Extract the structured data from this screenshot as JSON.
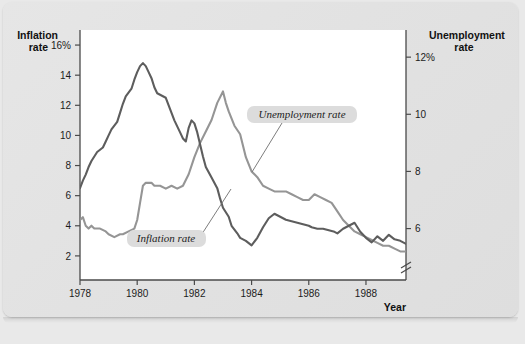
{
  "figure": {
    "background_color": "#e3e3e3",
    "plot_background_color": "#ffffff",
    "border_color": "#555555"
  },
  "labels": {
    "left_axis_title_line1": "Inflation",
    "left_axis_title_line2": "rate",
    "right_axis_title_line1": "Unemployment",
    "right_axis_title_line2": "rate",
    "x_axis_title": "Year"
  },
  "annotations": {
    "unemployment": "Unemployment rate",
    "inflation": "Inflation rate"
  },
  "chart_data": {
    "type": "line",
    "title": "",
    "subtitle": "",
    "xlabel": "Year",
    "ylabel": "Inflation rate",
    "y2label": "Unemployment rate",
    "grid": false,
    "legend": "annotations-inline",
    "xlim": [
      1978.0,
      1989.4
    ],
    "xticks": [
      1978,
      1980,
      1982,
      1984,
      1986,
      1988
    ],
    "xticklabels": [
      "1978",
      "1980",
      "1982",
      "1984",
      "1986",
      "1988"
    ],
    "ylim": [
      0.4,
      17.0
    ],
    "yticks": [
      2,
      4,
      6,
      8,
      10,
      12,
      14,
      16
    ],
    "yticklabels": [
      "2",
      "4",
      "6",
      "8",
      "10",
      "12",
      "14",
      "16%"
    ],
    "y2lim": [
      4.2,
      12.95
    ],
    "y2ticks": [
      6,
      8,
      10,
      12
    ],
    "y2ticklabels": [
      "6",
      "8",
      "10",
      "12%"
    ],
    "y2_axis_break": true,
    "colors": {
      "inflation": "#5d5d5d",
      "unemployment": "#959595"
    },
    "series": [
      {
        "name": "Inflation rate",
        "axis": "left",
        "color": "#5d5d5d",
        "x": [
          1978.0,
          1978.1,
          1978.2,
          1978.3,
          1978.4,
          1978.5,
          1978.6,
          1978.8,
          1978.9,
          1979.0,
          1979.1,
          1979.3,
          1979.4,
          1979.5,
          1979.6,
          1979.8,
          1979.9,
          1980.0,
          1980.1,
          1980.2,
          1980.3,
          1980.4,
          1980.5,
          1980.6,
          1980.7,
          1980.8,
          1980.9,
          1981.0,
          1981.1,
          1981.2,
          1981.3,
          1981.4,
          1981.5,
          1981.6,
          1981.7,
          1981.8,
          1981.9,
          1982.0,
          1982.1,
          1982.2,
          1982.3,
          1982.4,
          1982.6,
          1982.8,
          1982.9,
          1983.0,
          1983.2,
          1983.3,
          1983.5,
          1983.6,
          1983.8,
          1984.0,
          1984.2,
          1984.4,
          1984.6,
          1984.8,
          1985.0,
          1985.2,
          1985.4,
          1985.6,
          1985.8,
          1986.0,
          1986.1,
          1986.3,
          1986.5,
          1986.7,
          1986.9,
          1987.0,
          1987.2,
          1987.4,
          1987.6,
          1987.8,
          1988.0,
          1988.2,
          1988.4,
          1988.6,
          1988.8,
          1989.0,
          1989.2,
          1989.4
        ],
        "y": [
          6.5,
          7.0,
          7.4,
          7.9,
          8.3,
          8.6,
          8.9,
          9.2,
          9.6,
          10.0,
          10.4,
          10.9,
          11.5,
          12.1,
          12.6,
          13.1,
          13.7,
          14.2,
          14.6,
          14.8,
          14.6,
          14.2,
          13.8,
          13.2,
          12.8,
          12.7,
          12.6,
          12.5,
          12.0,
          11.5,
          11.0,
          10.6,
          10.2,
          9.8,
          9.6,
          10.5,
          11.0,
          10.8,
          10.2,
          9.4,
          8.6,
          7.9,
          7.2,
          6.5,
          5.8,
          5.2,
          4.6,
          4.0,
          3.5,
          3.2,
          3.0,
          2.7,
          3.2,
          3.9,
          4.5,
          4.8,
          4.6,
          4.4,
          4.3,
          4.2,
          4.1,
          4.0,
          3.9,
          3.8,
          3.8,
          3.7,
          3.6,
          3.5,
          3.8,
          4.0,
          4.2,
          3.6,
          3.2,
          2.9,
          3.3,
          3.0,
          3.4,
          3.1,
          3.0,
          2.8
        ]
      },
      {
        "name": "Unemployment rate",
        "axis": "right",
        "color": "#959595",
        "x": [
          1978.0,
          1978.1,
          1978.2,
          1978.3,
          1978.4,
          1978.5,
          1978.7,
          1978.9,
          1979.0,
          1979.2,
          1979.4,
          1979.5,
          1979.7,
          1979.9,
          1980.0,
          1980.1,
          1980.2,
          1980.3,
          1980.4,
          1980.5,
          1980.6,
          1980.8,
          1981.0,
          1981.2,
          1981.4,
          1981.6,
          1981.8,
          1982.0,
          1982.2,
          1982.4,
          1982.6,
          1982.8,
          1983.0,
          1983.1,
          1983.2,
          1983.4,
          1983.6,
          1983.8,
          1984.0,
          1984.2,
          1984.4,
          1984.6,
          1984.8,
          1985.0,
          1985.2,
          1985.4,
          1985.6,
          1985.8,
          1986.0,
          1986.2,
          1986.4,
          1986.6,
          1986.8,
          1987.0,
          1987.2,
          1987.4,
          1987.6,
          1987.8,
          1988.0,
          1988.2,
          1988.4,
          1988.6,
          1988.8,
          1989.0,
          1989.2,
          1989.4
        ],
        "y": [
          6.3,
          6.4,
          6.1,
          6.0,
          6.1,
          6.0,
          6.0,
          5.9,
          5.8,
          5.7,
          5.8,
          5.8,
          5.9,
          6.0,
          6.3,
          6.9,
          7.5,
          7.6,
          7.6,
          7.6,
          7.5,
          7.5,
          7.4,
          7.5,
          7.4,
          7.5,
          7.9,
          8.5,
          9.0,
          9.4,
          9.8,
          10.4,
          10.8,
          10.4,
          10.1,
          9.6,
          9.3,
          8.5,
          8.0,
          7.8,
          7.5,
          7.4,
          7.3,
          7.3,
          7.3,
          7.2,
          7.1,
          7.0,
          7.0,
          7.2,
          7.1,
          7.0,
          6.9,
          6.6,
          6.3,
          6.1,
          5.9,
          5.8,
          5.7,
          5.6,
          5.5,
          5.4,
          5.4,
          5.3,
          5.2,
          5.2
        ]
      }
    ]
  }
}
